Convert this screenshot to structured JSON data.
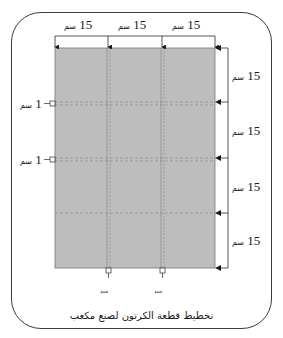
{
  "colors": {
    "sheet_fill": "#bdbdbd",
    "line": "#2b2b2b",
    "fold_line": "#8a8a8a",
    "frame": "#3a3a3a"
  },
  "top_dimensions": [
    {
      "value": "15",
      "unit": "سم"
    },
    {
      "value": "15",
      "unit": "سم"
    },
    {
      "value": "15",
      "unit": "سم"
    }
  ],
  "right_dimensions": [
    {
      "value": "15",
      "unit": "سم"
    },
    {
      "value": "15",
      "unit": "سم"
    },
    {
      "value": "15",
      "unit": "سم"
    },
    {
      "value": "15",
      "unit": "سم"
    }
  ],
  "left_tabs": [
    {
      "value": "1",
      "unit": "سم"
    },
    {
      "value": "1",
      "unit": "سم"
    }
  ],
  "bottom_tabs": [
    {
      "value": "1",
      "unit": "سم"
    },
    {
      "value": "1",
      "unit": "سم"
    }
  ],
  "caption": "تخطيط قطعة الكرتون لصنع مكعب"
}
